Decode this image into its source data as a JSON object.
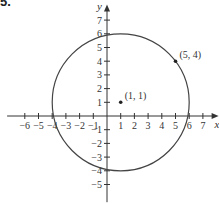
{
  "figure_label": "5.",
  "chart_data": {
    "type": "scatter",
    "title": "",
    "xlabel": "x",
    "ylabel": "y",
    "xlim": [
      -7,
      8
    ],
    "ylim": [
      -6,
      8
    ],
    "x_ticks": [
      -6,
      -5,
      -4,
      -3,
      -2,
      -1,
      1,
      2,
      3,
      4,
      5,
      6,
      7
    ],
    "y_ticks": [
      -5,
      -4,
      -3,
      -2,
      -1,
      1,
      2,
      3,
      4,
      5,
      6,
      7
    ],
    "grid": false,
    "legend": null,
    "shapes": [
      {
        "kind": "circle",
        "center": [
          1,
          1
        ],
        "radius": 5
      }
    ],
    "points": [
      {
        "x": 1,
        "y": 1,
        "label": "(1, 1)"
      },
      {
        "x": 5,
        "y": 4,
        "label": "(5, 4)"
      }
    ]
  },
  "colors": {
    "axis": "#333333",
    "curve": "#444444",
    "text": "#333333"
  },
  "layout": {
    "origin_px": [
      107,
      116
    ],
    "unit_px": 13.7
  }
}
